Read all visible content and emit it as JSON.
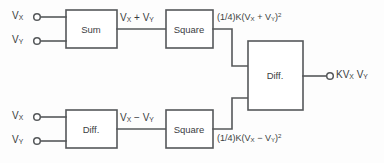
{
  "diagram": {
    "stroke_color": "#55585a",
    "text_color": "#3b3d3f",
    "background_color": "#fdfdfd",
    "blocks": [
      {
        "id": "sum",
        "label": "Sum"
      },
      {
        "id": "square-top",
        "label": "Square"
      },
      {
        "id": "diff-left",
        "label": "Diff."
      },
      {
        "id": "square-bottom",
        "label": "Square"
      },
      {
        "id": "diff-right",
        "label": "Diff."
      }
    ],
    "inputs": [
      {
        "id": "in-top-x",
        "base": "V",
        "sub": "X"
      },
      {
        "id": "in-top-y",
        "base": "V",
        "sub": "Y"
      },
      {
        "id": "in-bottom-x",
        "base": "V",
        "sub": "X"
      },
      {
        "id": "in-bottom-y",
        "base": "V",
        "sub": "Y"
      }
    ],
    "signals": {
      "sum_out": {
        "v1": "V",
        "v1sub": "X",
        "op": "+",
        "v2": "V",
        "v2sub": "Y"
      },
      "diff_out": {
        "v1": "V",
        "v1sub": "X",
        "op": "−",
        "v2": "V",
        "v2sub": "Y"
      },
      "square_top_out": {
        "coef": "(1/4)K(",
        "v1": "V",
        "v1sub": "X",
        "op": "+",
        "v2": "V",
        "v2sub": "Y",
        "close": ")",
        "exp": "2"
      },
      "square_bottom_out": {
        "coef": "(1/4)K(",
        "v1": "V",
        "v1sub": "X",
        "op": "−",
        "v2": "V",
        "v2sub": "Y",
        "close": ")",
        "exp": "2"
      },
      "output": {
        "coef": "K",
        "v1": "V",
        "v1sub": "X",
        "v2": "V",
        "v2sub": "Y"
      }
    }
  }
}
